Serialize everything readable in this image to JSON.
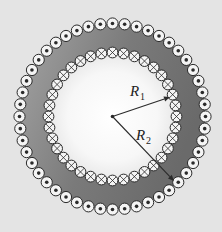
{
  "diagram": {
    "center": [
      112.5,
      116.5
    ],
    "outer_ring": {
      "radius": 93,
      "count": 48,
      "symbol": "dot",
      "meaning": "current out of page"
    },
    "inner_ring": {
      "radius": 64,
      "count": 36,
      "symbol": "cross",
      "meaning": "current into page"
    },
    "labels": {
      "r1": {
        "main": "R",
        "sub": "1"
      },
      "r2": {
        "main": "R",
        "sub": "2"
      }
    },
    "arrows": {
      "r1_end": [
        170,
        97
      ],
      "r2_end": [
        174,
        181
      ]
    },
    "colors": {
      "background": "#e4e4e4",
      "annulus_dark": "#6a6a6a",
      "annulus_light": "#a4a4a4",
      "inner_fill_center": "#ffffff",
      "inner_fill_edge": "#e8e8e8",
      "circle_fill": "#f4f4f4",
      "ink": "#2a2a2a"
    }
  }
}
